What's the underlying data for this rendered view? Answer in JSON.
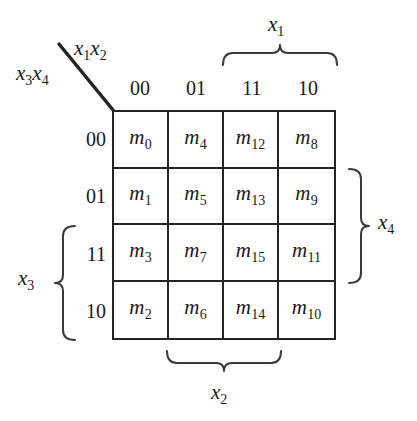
{
  "diagram": {
    "type": "karnaugh-map",
    "variables": 4,
    "corner": {
      "top_right_label": "x1x2",
      "bottom_left_label": "x3x4",
      "top_var1": "x",
      "top_sub1": "1",
      "top_var2": "x",
      "top_sub2": "2",
      "left_var1": "x",
      "left_sub1": "3",
      "left_var2": "x",
      "left_sub2": "4"
    },
    "column_headers": [
      "00",
      "01",
      "11",
      "10"
    ],
    "row_headers": [
      "00",
      "01",
      "11",
      "10"
    ],
    "cells": [
      [
        "m0",
        "m4",
        "m12",
        "m8"
      ],
      [
        "m1",
        "m5",
        "m13",
        "m9"
      ],
      [
        "m3",
        "m7",
        "m15",
        "m11"
      ],
      [
        "m2",
        "m6",
        "m14",
        "m10"
      ]
    ],
    "cell_subscripts": [
      [
        "0",
        "4",
        "12",
        "8"
      ],
      [
        "1",
        "5",
        "13",
        "9"
      ],
      [
        "3",
        "7",
        "15",
        "11"
      ],
      [
        "2",
        "6",
        "14",
        "10"
      ]
    ],
    "cell_symbol": "m",
    "braces": [
      {
        "name": "x1",
        "var": "x",
        "sub": "1",
        "position": "top",
        "spans_labels": [
          "11",
          "10"
        ]
      },
      {
        "name": "x2",
        "var": "x",
        "sub": "2",
        "position": "bottom",
        "spans_labels": [
          "01",
          "11"
        ]
      },
      {
        "name": "x3",
        "var": "x",
        "sub": "3",
        "position": "left",
        "spans_labels": [
          "11",
          "10"
        ]
      },
      {
        "name": "x4",
        "var": "x",
        "sub": "4",
        "position": "right",
        "spans_labels": [
          "01",
          "11"
        ]
      }
    ],
    "colors": {
      "background": "#ffffff",
      "grid_line": "#242424",
      "text": "#1a1a1a",
      "brace_line": "#3a3a3a"
    }
  }
}
